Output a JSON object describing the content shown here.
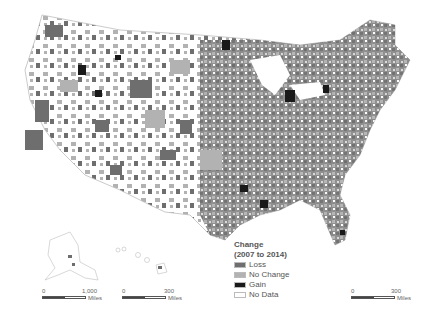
{
  "map": {
    "title": "Change in land cover (2007 to 2014)",
    "colors": {
      "loss": "#6e6e6e",
      "no_change": "#b2b2b2",
      "gain": "#1a1a1a",
      "no_data": "#ffffff",
      "boundary": "#cfcfcf"
    }
  },
  "legend": {
    "title_line1": "Change",
    "title_line2": "(2007 to 2014)",
    "items": [
      {
        "label": "Loss",
        "color": "#6e6e6e"
      },
      {
        "label": "No Change",
        "color": "#b2b2b2"
      },
      {
        "label": "Gain",
        "color": "#1a1a1a"
      },
      {
        "label": "No Data",
        "color": "#ffffff"
      }
    ]
  },
  "scalebars": [
    {
      "region": "Alaska",
      "start": "0",
      "end": "1,000",
      "unit": "Miles"
    },
    {
      "region": "Hawaii",
      "start": "0",
      "end": "300",
      "unit": "Miles"
    },
    {
      "region": "Contiguous US",
      "start": "0",
      "end": "300",
      "unit": "Miles"
    }
  ]
}
